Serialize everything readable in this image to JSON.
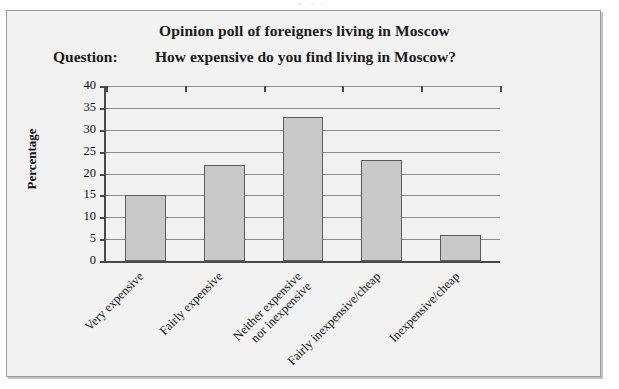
{
  "figure": {
    "title": "Opinion poll of foreigners living in Moscow",
    "question_label": "Question:",
    "question_text": "How expensive do you find living in Moscow?",
    "top_clipped_text": "Activity"
  },
  "colors": {
    "bar_fill": "#c9c9c9",
    "bar_stroke": "#5c5c5c",
    "axis": "#4a4a4a",
    "gridline": "#8e8e8e",
    "frame_bg": "#f2f2f2",
    "frame_border": "#9b9b9b",
    "text": "#111111"
  },
  "chart_data": {
    "type": "bar",
    "title": "Opinion poll of foreigners living in Moscow",
    "subtitle": "Question: How expensive do you find living in Moscow?",
    "categories": [
      "Very expensive",
      "Fairly expensive",
      "Neither expensive\nnor inexpensive",
      "Fairly inexpensive/cheap",
      "Inexpensive/cheap"
    ],
    "category_lines": [
      [
        "Very expensive"
      ],
      [
        "Fairly expensive"
      ],
      [
        "Neither expensive",
        "nor inexpensive"
      ],
      [
        "Fairly inexpensive/cheap"
      ],
      [
        "Inexpensive/cheap"
      ]
    ],
    "values": [
      15,
      22,
      33,
      23,
      6
    ],
    "xlabel": "",
    "ylabel": "Percentage",
    "ylim": [
      0,
      40
    ],
    "yticks": [
      0,
      5,
      10,
      15,
      20,
      25,
      30,
      35,
      40
    ],
    "ytick_labels": [
      "0",
      "5",
      "10",
      "15",
      "20",
      "25",
      "30",
      "35",
      "40"
    ],
    "grid": true,
    "legend": false,
    "legend_position": "none"
  }
}
